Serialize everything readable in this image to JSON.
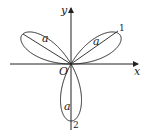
{
  "figure": {
    "type": "three-leaved rose (polar curve)",
    "axes": {
      "x_label": "x",
      "y_label": "y",
      "origin_label": "O"
    },
    "leaves": [
      {
        "position": "upper-right",
        "radius_label": "a",
        "tip_label": "1"
      },
      {
        "position": "upper-left",
        "radius_label": "a"
      },
      {
        "position": "bottom",
        "radius_label": "a",
        "tip_label": "2"
      }
    ],
    "colors": {
      "stroke": "#222222",
      "background": "#ffffff"
    }
  }
}
